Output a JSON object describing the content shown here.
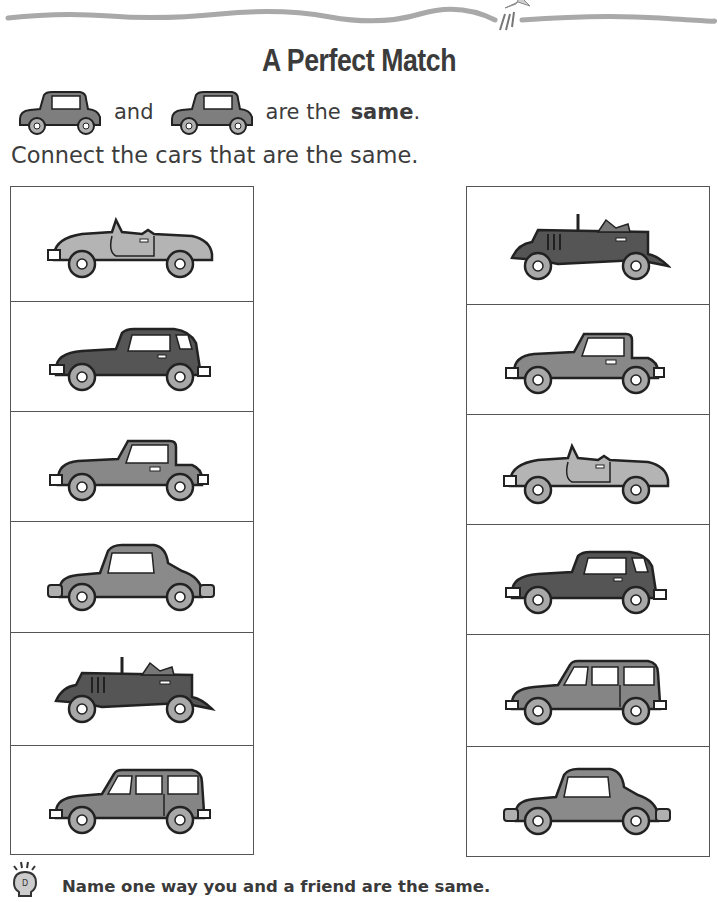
{
  "page": {
    "title": "A Perfect Match",
    "example": {
      "car_icon": "sedan-car-icon",
      "word_and": "and",
      "word_are_the": "are the",
      "word_same": "same",
      "period": "."
    },
    "instruction": "Connect the cars that are the same.",
    "left_column": [
      {
        "car": "convertible-roadster",
        "shade": "light"
      },
      {
        "car": "fastback-coupe",
        "shade": "dark"
      },
      {
        "car": "jeep-hardtop",
        "shade": "medium"
      },
      {
        "car": "bubble-car",
        "shade": "medium"
      },
      {
        "car": "vintage-touring-car",
        "shade": "dark"
      },
      {
        "car": "station-wagon",
        "shade": "medium"
      }
    ],
    "right_column": [
      {
        "car": "vintage-touring-car",
        "shade": "dark"
      },
      {
        "car": "jeep-hardtop",
        "shade": "medium"
      },
      {
        "car": "convertible-roadster",
        "shade": "light"
      },
      {
        "car": "fastback-coupe",
        "shade": "dark"
      },
      {
        "car": "station-wagon",
        "shade": "medium"
      },
      {
        "car": "bubble-car",
        "shade": "medium"
      }
    ],
    "tip": {
      "icon": "lightbulb-icon",
      "text": "Name one way you and a friend are the same."
    },
    "colors": {
      "light_body": "#b4b4b4",
      "medium_body": "#878787",
      "dark_body": "#555555",
      "wheel": "#a8a8a8",
      "outline": "#222222",
      "border": "#555555",
      "top_stroke": "#a0a0a0"
    }
  }
}
